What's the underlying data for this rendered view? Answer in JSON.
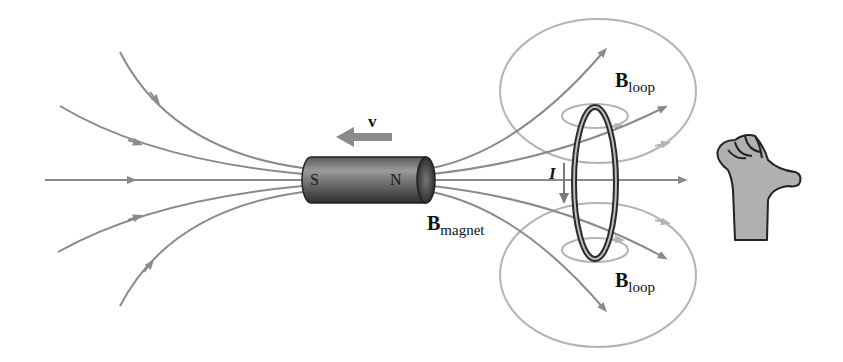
{
  "diagram": {
    "labels": {
      "velocity": "v",
      "magnet_south": "S",
      "magnet_north": "N",
      "current": "I",
      "b_magnet_main": "B",
      "b_magnet_sub": "magnet",
      "b_loop_top_main": "B",
      "b_loop_top_sub": "loop",
      "b_loop_bottom_main": "B",
      "b_loop_bottom_sub": "loop"
    },
    "elements": [
      {
        "name": "bar-magnet",
        "description": "cylindrical bar magnet, S on left, N on right"
      },
      {
        "name": "velocity-arrow",
        "direction": "left"
      },
      {
        "name": "magnet-field-lines",
        "count": 10,
        "direction": "left-to-right"
      },
      {
        "name": "current-loop",
        "description": "vertical ring conductor"
      },
      {
        "name": "current-arrow",
        "direction": "down"
      },
      {
        "name": "loop-field-lines",
        "description": "concentric ellipses above and below the loop"
      },
      {
        "name": "right-hand-rule-hand",
        "description": "fist with thumb pointing right"
      }
    ],
    "colors": {
      "field_line": "#8a8a8a",
      "loop_field_line": "#b4b4b4",
      "magnet_dark": "#3a3a3a",
      "magnet_light": "#9a9a9a",
      "hand_fill": "#b0b0b0",
      "text": "#111111"
    }
  }
}
